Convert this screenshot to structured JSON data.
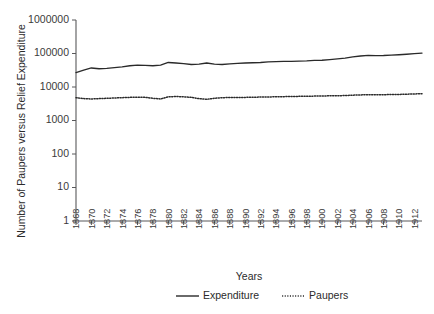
{
  "chart_data": {
    "type": "line",
    "title": "",
    "xlabel": "Years",
    "ylabel": "Number of Paupers versus Relief Expenditure",
    "yscale": "log",
    "ylim": [
      1,
      1000000
    ],
    "ytick_labels": [
      "1",
      "10",
      "100",
      "1000",
      "10000",
      "100000",
      "1000000"
    ],
    "ytick_values": [
      1,
      10,
      100,
      1000,
      10000,
      100000,
      1000000
    ],
    "xlim": [
      1868,
      1913
    ],
    "xtick_labels": [
      "1868",
      "1870",
      "1872",
      "1874",
      "1876",
      "1878",
      "1880",
      "1882",
      "1884",
      "1886",
      "1888",
      "1890",
      "1892",
      "1894",
      "1896",
      "1898",
      "1900",
      "1902",
      "1904",
      "1906",
      "1908",
      "1910",
      "1912"
    ],
    "xtick_values": [
      1868,
      1870,
      1872,
      1874,
      1876,
      1878,
      1880,
      1882,
      1884,
      1886,
      1888,
      1890,
      1892,
      1894,
      1896,
      1898,
      1900,
      1902,
      1904,
      1906,
      1908,
      1910,
      1912
    ],
    "grid": false,
    "legend_position": "bottom",
    "x": [
      1868,
      1869,
      1870,
      1871,
      1872,
      1873,
      1874,
      1875,
      1876,
      1877,
      1878,
      1879,
      1880,
      1881,
      1882,
      1883,
      1884,
      1885,
      1886,
      1887,
      1888,
      1889,
      1890,
      1891,
      1892,
      1893,
      1894,
      1895,
      1896,
      1897,
      1898,
      1899,
      1900,
      1901,
      1902,
      1903,
      1904,
      1905,
      1906,
      1907,
      1908,
      1909,
      1910,
      1911,
      1912,
      1913
    ],
    "series": [
      {
        "name": "Expenditure",
        "style": "solid",
        "color": "#2a2a2a",
        "values": [
          27000,
          32000,
          37000,
          35000,
          36000,
          38000,
          40000,
          43000,
          45000,
          44000,
          43000,
          45000,
          54000,
          52000,
          50000,
          47000,
          48000,
          52000,
          48000,
          47000,
          49000,
          51000,
          52000,
          53000,
          54000,
          56000,
          57000,
          58000,
          58000,
          59000,
          60000,
          62000,
          63000,
          66000,
          69000,
          73000,
          79000,
          84000,
          88000,
          86000,
          87000,
          89000,
          92000,
          95000,
          99000,
          103000
        ]
      },
      {
        "name": "Paupers",
        "style": "dotted",
        "color": "#2a2a2a",
        "values": [
          4800,
          4500,
          4400,
          4500,
          4600,
          4700,
          4800,
          4900,
          4950,
          4900,
          4600,
          4400,
          5100,
          5200,
          5100,
          4900,
          4500,
          4300,
          4600,
          4800,
          4850,
          4900,
          4900,
          4950,
          5000,
          5050,
          5100,
          5150,
          5200,
          5250,
          5300,
          5350,
          5400,
          5450,
          5500,
          5550,
          5700,
          5800,
          5900,
          5850,
          5900,
          5950,
          6000,
          6100,
          6200,
          6300
        ]
      }
    ],
    "legend": [
      {
        "label": "Expenditure",
        "style": "solid"
      },
      {
        "label": "Paupers",
        "style": "dotted"
      }
    ]
  }
}
